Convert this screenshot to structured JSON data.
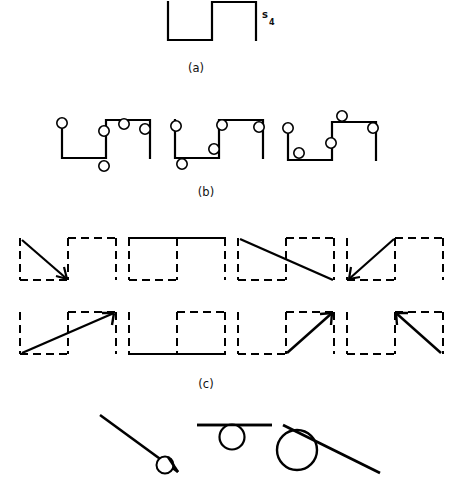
{
  "figure": {
    "background_color": "#ffffff",
    "ink_color": "#000000",
    "captions": {
      "a": "(a)",
      "b": "(b)",
      "c": "(c)"
    },
    "labels": {
      "signal_base": "s",
      "signal_subscript": "4"
    },
    "panel_a": {
      "name": "square-wave-waveform",
      "description": "Open square-wave path: down, across, up, across, down",
      "stroke_width": 2.2,
      "points": [
        [
          168,
          2
        ],
        [
          168,
          40
        ],
        [
          212,
          40
        ],
        [
          212,
          2
        ],
        [
          256,
          2
        ],
        [
          256,
          40
        ]
      ]
    },
    "panel_b": {
      "name": "marker-variants",
      "stroke_width": 2.2,
      "marker_radius": 5.2,
      "marker_stroke_width": 1.6,
      "variants": [
        {
          "name": "variant-1",
          "path": [
            [
              62,
              120
            ],
            [
              62,
              158
            ],
            [
              106,
              158
            ],
            [
              106,
              120
            ],
            [
              150,
              120
            ],
            [
              150,
              158
            ]
          ],
          "markers": [
            [
              62,
              123
            ],
            [
              104,
              131
            ],
            [
              124,
              124
            ],
            [
              145,
              129
            ]
          ]
        },
        {
          "name": "variant-2",
          "path": [
            [
              175,
              120
            ],
            [
              175,
              158
            ],
            [
              219,
              158
            ],
            [
              219,
              120
            ],
            [
              263,
              120
            ],
            [
              263,
              158
            ]
          ],
          "markers": [
            [
              176,
              126
            ],
            [
              181,
              163
            ],
            [
              213,
              148
            ],
            [
              219,
              125
            ]
          ]
        },
        {
          "name": "variant-3",
          "path": [
            [
              288,
              128
            ],
            [
              288,
              160
            ],
            [
              332,
              160
            ],
            [
              332,
              122
            ],
            [
              376,
              122
            ],
            [
              376,
              160
            ]
          ],
          "markers": [
            [
              288,
              128
            ],
            [
              299,
              153
            ],
            [
              331,
              143
            ],
            [
              342,
              116
            ],
            [
              373,
              128
            ]
          ]
        }
      ]
    },
    "panel_c": {
      "name": "transition-cells",
      "dash_pattern": "8 5",
      "dash_stroke_width": 2.0,
      "solid_stroke_width": 2.2,
      "cell_width": 48,
      "cell_height": 42,
      "rows": [
        {
          "name": "row-1",
          "cells": [
            {
              "name": "cell-1-1",
              "arrow": "diagonal-down-right-left-box",
              "arrowhead": true,
              "solid_edges": []
            },
            {
              "name": "cell-1-2",
              "arrow": "none",
              "arrowhead": false,
              "solid_edges": [
                "top-left",
                "top-right"
              ]
            },
            {
              "name": "cell-1-3",
              "arrow": "diagonal-down-right-span",
              "arrowhead": false,
              "solid_edges": []
            },
            {
              "name": "cell-1-4",
              "arrow": "diagonal-down-left-left-box",
              "arrowhead": true,
              "solid_edges": []
            }
          ]
        },
        {
          "name": "row-2",
          "cells": [
            {
              "name": "cell-2-1",
              "arrow": "diagonal-up-right-span",
              "arrowhead": true,
              "solid_edges": []
            },
            {
              "name": "cell-2-2",
              "arrow": "none",
              "arrowhead": false,
              "solid_edges": [
                "bottom-left",
                "bottom-right"
              ]
            },
            {
              "name": "cell-2-3",
              "arrow": "diagonal-up-right-right-box",
              "arrowhead": true,
              "solid_edges": []
            },
            {
              "name": "cell-2-4",
              "arrow": "diagonal-down-right-right-box",
              "arrowhead": true,
              "solid_edges": []
            }
          ]
        }
      ]
    },
    "panel_d": {
      "name": "tangent-circle-sketches",
      "items": [
        {
          "name": "sketch-steep-line-small-circle",
          "line": [
            [
              100,
              415
            ],
            [
              178,
              472
            ]
          ],
          "circle": {
            "cx": 165,
            "cy": 465,
            "r": 8.5
          },
          "line_stroke_width": 2.6,
          "circle_stroke_width": 2.0
        },
        {
          "name": "sketch-horizontal-line-circle",
          "line": [
            [
              200,
              425
            ],
            [
              268,
              425
            ]
          ],
          "circle": {
            "cx": 232,
            "cy": 437,
            "r": 12.5
          },
          "line_stroke_width": 2.6,
          "circle_stroke_width": 2.2
        },
        {
          "name": "sketch-sloped-line-large-circle",
          "line": [
            [
              285,
              425
            ],
            [
              380,
              472
            ]
          ],
          "circle": {
            "cx": 297,
            "cy": 450,
            "r": 20
          },
          "line_stroke_width": 2.8,
          "circle_stroke_width": 2.4
        }
      ]
    }
  }
}
